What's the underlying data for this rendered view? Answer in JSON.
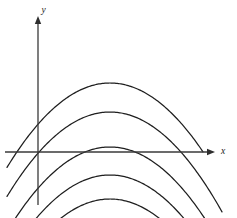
{
  "figure": {
    "background_color": "#ffffff",
    "width": 237,
    "height": 218
  },
  "axes": {
    "x_label": "x",
    "y_label": "y",
    "x_axis_color": "#3a3a3a",
    "y_axis_color": "#3a3a3a",
    "x_axis_pixel_y": 152,
    "y_axis_pixel_x": 38,
    "x_axis_start_px": 5,
    "x_axis_end_px": 215,
    "y_axis_top_px": 16,
    "y_axis_bottom_px": 205,
    "arrowheads": [
      "x-positive",
      "y-positive"
    ]
  },
  "chart_data": {
    "type": "line",
    "title": "",
    "subtitle": "",
    "xlabel": "x",
    "ylabel": "y",
    "grid": false,
    "legend": "none",
    "annotations": [],
    "xlim": [
      -4.2,
      4.4
    ],
    "ylim": [
      -2.6,
      5.2
    ],
    "origin_px": [
      38,
      152
    ],
    "px_per_unit_x": 24.5,
    "px_per_unit_y": 24.5,
    "curve_form": "y = a*(x - h)^2 + k",
    "shared_a": 0.195,
    "shared_h_units": 2.94,
    "vertex_x_px": 110,
    "series": [
      {
        "name": "curve-1",
        "k_units": -2.82,
        "vertex_px": [
          110,
          83
        ],
        "left_end_px": [
          7,
          25
        ],
        "right_end_px": [
          203,
          26
        ],
        "stroke": "#1e1e1e"
      },
      {
        "name": "curve-2",
        "k_units": -1.63,
        "vertex_px": [
          110,
          112
        ],
        "left_end_px": [
          7,
          40
        ],
        "right_end_px": [
          222,
          42
        ],
        "stroke": "#1e1e1e"
      },
      {
        "name": "curve-3",
        "k_units": -0.2,
        "vertex_px": [
          110,
          147
        ],
        "left_end_px": [
          7,
          78
        ],
        "right_end_px": [
          231,
          82
        ],
        "stroke": "#1e1e1e"
      },
      {
        "name": "curve-4",
        "k_units": 0.94,
        "vertex_px": [
          110,
          175
        ],
        "left_end_px": [
          8,
          102
        ],
        "right_end_px": [
          233,
          122
        ],
        "stroke": "#1e1e1e"
      },
      {
        "name": "curve-5",
        "k_units": 1.92,
        "vertex_px": [
          110,
          199
        ],
        "left_end_px": [
          8,
          130
        ],
        "right_end_px": [
          226,
          147
        ],
        "stroke": "#1e1e1e"
      }
    ]
  }
}
